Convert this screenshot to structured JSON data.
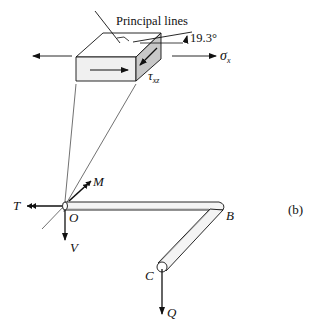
{
  "figure": {
    "panel_label": "(b)",
    "element": {
      "title": "Principal lines",
      "angle_label": "19.3°",
      "normal_stress_label": "σ",
      "normal_stress_sub": "x",
      "shear_stress_label": "τ",
      "shear_stress_sub": "xz"
    },
    "bar": {
      "points": {
        "O": "O",
        "B": "B",
        "C": "C"
      },
      "forces": {
        "torque": "T",
        "moment": "M",
        "shear": "V",
        "load": "Q"
      }
    }
  },
  "colors": {
    "ink": "#111111",
    "face_front": "#f0f0f0",
    "face_side": "#c8c8c8",
    "face_top": "#ffffff",
    "bar_fill": "#f4f4f4"
  }
}
